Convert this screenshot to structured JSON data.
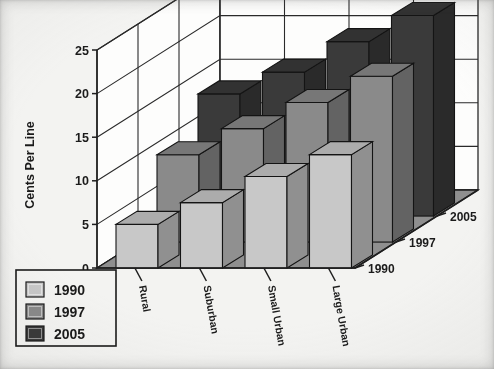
{
  "chart_data": {
    "type": "bar",
    "title": "",
    "subtitle": "",
    "xlabel": "",
    "ylabel": "Cents Per Line",
    "zlabel": "",
    "ylim": [
      0,
      25
    ],
    "yticks": [
      0,
      5,
      10,
      15,
      20,
      25
    ],
    "grid": true,
    "projection": "3d-grouped-bars",
    "legend_position": "bottom-left",
    "categories": [
      "Rural",
      "Suburban",
      "Small Urban",
      "Large Urban"
    ],
    "depth_axis_labels": [
      "1990",
      "1997",
      "2005"
    ],
    "series": [
      {
        "name": "1990",
        "color": "#c8c8c8",
        "values": [
          5,
          7.5,
          10.5,
          13
        ]
      },
      {
        "name": "1997",
        "color": "#8a8a8a",
        "values": [
          10,
          13,
          16,
          19
        ]
      },
      {
        "name": "2005",
        "color": "#3a3a3a",
        "values": [
          14,
          16.5,
          20,
          23
        ]
      }
    ],
    "legend": [
      {
        "label": "1990",
        "color": "#c8c8c8"
      },
      {
        "label": "1997",
        "color": "#8a8a8a"
      },
      {
        "label": "2005",
        "color": "#3a3a3a"
      }
    ]
  },
  "axis": {
    "y_title": "Cents Per Line",
    "y_tick_labels": [
      "0",
      "5",
      "10",
      "15",
      "20",
      "25"
    ],
    "category_labels": [
      "Rural",
      "Suburban",
      "Small Urban",
      "Large Urban"
    ],
    "depth_labels": [
      "1990",
      "1997",
      "2005"
    ]
  },
  "legend": {
    "items": [
      {
        "label": "1990"
      },
      {
        "label": "1997"
      },
      {
        "label": "2005"
      }
    ]
  },
  "colors": {
    "series_1990": "#c8c8c8",
    "series_1997": "#8a8a8a",
    "series_2005": "#3a3a3a",
    "floor": "#8f8f8f",
    "grid": "#2a2a2a",
    "background": "#f3f3f1"
  }
}
